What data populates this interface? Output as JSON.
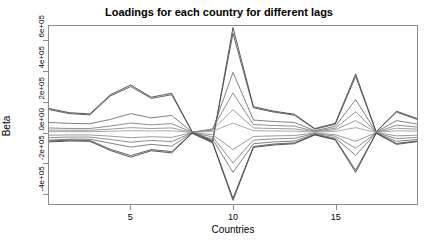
{
  "chart_data": {
    "type": "line",
    "title": "Loadings for each country for different lags",
    "xlabel": "Countries",
    "ylabel": "Beta",
    "xlim": [
      1,
      19
    ],
    "ylim": [
      -470000,
      700000
    ],
    "grid": false,
    "legend": null,
    "xticks": [
      5,
      10,
      15
    ],
    "xtick_labels": [
      "5",
      "10",
      "15"
    ],
    "yticks": [
      -400000,
      -200000,
      0,
      200000,
      400000,
      600000
    ],
    "ytick_labels": [
      "-4e+05",
      "-2e+05",
      "0e+00",
      "2e+05",
      "4e+05",
      "6e+05"
    ],
    "x": [
      1,
      2,
      3,
      4,
      5,
      6,
      7,
      8,
      9,
      10,
      11,
      12,
      13,
      14,
      15,
      16,
      17,
      18,
      19
    ],
    "series": [
      {
        "name": "lag-1",
        "color": "#3c3c3c",
        "values": [
          158000,
          130000,
          122000,
          248000,
          312000,
          232000,
          258000,
          5000,
          -60000,
          690000,
          170000,
          140000,
          120000,
          26000,
          60000,
          385000,
          5000,
          140000,
          92000
        ]
      },
      {
        "name": "lag-2",
        "color": "#4a4a4a",
        "values": [
          150000,
          124000,
          116000,
          240000,
          302000,
          224000,
          248000,
          4000,
          -54000,
          652000,
          162000,
          134000,
          114000,
          22000,
          54000,
          368000,
          4000,
          134000,
          86000
        ]
      },
      {
        "name": "lag-3",
        "color": "#6a6a6a",
        "values": [
          66000,
          60000,
          58000,
          86000,
          124000,
          96000,
          112000,
          3000,
          16000,
          395000,
          82000,
          72000,
          66000,
          12000,
          40000,
          216000,
          3000,
          78000,
          56000
        ]
      },
      {
        "name": "lag-4",
        "color": "#7a7a7a",
        "values": [
          30000,
          26000,
          26000,
          42000,
          62000,
          50000,
          58000,
          2000,
          24000,
          260000,
          52000,
          46000,
          42000,
          8000,
          28000,
          136000,
          2000,
          48000,
          36000
        ]
      },
      {
        "name": "lag-5",
        "color": "#8a8a8a",
        "values": [
          16000,
          14000,
          14000,
          22000,
          32000,
          26000,
          30000,
          1000,
          18000,
          150000,
          30000,
          26000,
          24000,
          5000,
          18000,
          78000,
          1000,
          28000,
          22000
        ]
      },
      {
        "name": "lag-6",
        "color": "#9a9a9a",
        "values": [
          6000,
          5000,
          5000,
          8000,
          12000,
          10000,
          11000,
          500,
          8000,
          62000,
          12000,
          10000,
          9000,
          2000,
          7000,
          32000,
          500,
          11000,
          9000
        ]
      },
      {
        "name": "lag-7",
        "color": "#8a8a8a",
        "values": [
          -18000,
          -16000,
          -16000,
          -24000,
          -34000,
          -28000,
          -32000,
          -1000,
          -14000,
          -112000,
          -26000,
          -22000,
          -20000,
          -4000,
          -14000,
          -58000,
          -1000,
          -22000,
          -18000
        ]
      },
      {
        "name": "lag-8",
        "color": "#7a7a7a",
        "values": [
          -34000,
          -30000,
          -30000,
          -46000,
          -64000,
          -52000,
          -60000,
          -2000,
          -28000,
          -200000,
          -50000,
          -42000,
          -38000,
          -7000,
          -24000,
          -104000,
          -2000,
          -40000,
          -32000
        ]
      },
      {
        "name": "lag-9",
        "color": "#6a6a6a",
        "values": [
          -50000,
          -44000,
          -44000,
          -70000,
          -96000,
          -78000,
          -90000,
          -3000,
          -44000,
          -262000,
          -74000,
          -62000,
          -56000,
          -11000,
          -36000,
          -150000,
          -3000,
          -58000,
          -46000
        ]
      },
      {
        "name": "lag-10",
        "color": "#4a4a4a",
        "values": [
          -56000,
          -50000,
          -52000,
          -110000,
          -152000,
          -112000,
          -126000,
          -4000,
          -62000,
          -432000,
          -92000,
          -76000,
          -68000,
          -14000,
          -44000,
          -248000,
          -4000,
          -72000,
          -56000
        ]
      },
      {
        "name": "lag-11",
        "color": "#3c3c3c",
        "values": [
          -62000,
          -56000,
          -58000,
          -118000,
          -162000,
          -120000,
          -134000,
          -5000,
          -68000,
          -446000,
          -98000,
          -82000,
          -74000,
          -16000,
          -48000,
          -262000,
          -5000,
          -78000,
          -60000
        ]
      }
    ]
  },
  "axes": {
    "box_color": "#8d8d8d",
    "line_color_dark": "#3c3c3c",
    "line_color_light": "#9a9a9a"
  }
}
